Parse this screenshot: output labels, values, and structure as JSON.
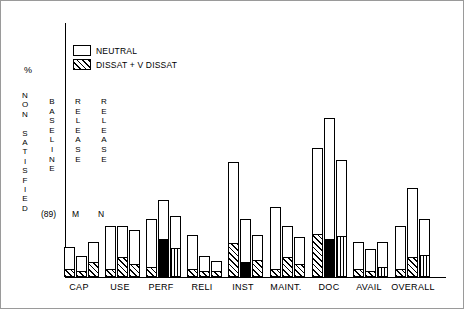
{
  "chart_data": {
    "type": "bar",
    "title": "",
    "xlabel": "",
    "ylabel": "% NON SATISFIED",
    "ylim": [
      0,
      100
    ],
    "grid": false,
    "legend_position": "top-left-inside",
    "legend": [
      {
        "label": "NEUTRAL",
        "pattern": "open"
      },
      {
        "label": "DISSAT + V DISSAT",
        "pattern": "diagonal-hatch"
      }
    ],
    "annotations": [
      {
        "text": "BASELINE",
        "orientation": "vertical",
        "note": "(89)"
      },
      {
        "text": "RELEASE",
        "orientation": "vertical",
        "note": "M"
      },
      {
        "text": "RELEASE",
        "orientation": "vertical",
        "note": "N"
      }
    ],
    "categories": [
      "CAP",
      "USE",
      "PERF",
      "RELI",
      "INST",
      "MAINT.",
      "DOC",
      "AVAIL",
      "OVERALL"
    ],
    "series": [
      {
        "name": "NEUTRAL",
        "pattern": "open"
      },
      {
        "name": "DISSAT + V DISSAT",
        "pattern": "hatch"
      }
    ],
    "groups": [
      {
        "category": "CAP",
        "bars": [
          {
            "release": "BASELINE (89)",
            "total": 13,
            "neutral": 10,
            "dissat": 3
          },
          {
            "release": "RELEASE M",
            "total": 9,
            "neutral": 7,
            "dissat": 2
          },
          {
            "release": "RELEASE N",
            "total": 15,
            "neutral": 9,
            "dissat": 6
          }
        ]
      },
      {
        "category": "USE",
        "bars": [
          {
            "release": "BASELINE (89)",
            "total": 22,
            "neutral": 19,
            "dissat": 3
          },
          {
            "release": "RELEASE M",
            "total": 22,
            "neutral": 14,
            "dissat": 8
          },
          {
            "release": "RELEASE N",
            "total": 20,
            "neutral": 15,
            "dissat": 5
          }
        ]
      },
      {
        "category": "PERF",
        "bars": [
          {
            "release": "BASELINE (89)",
            "total": 25,
            "neutral": 21,
            "dissat": 4
          },
          {
            "release": "RELEASE M",
            "total": 33,
            "neutral": 17,
            "dissat": 16
          },
          {
            "release": "RELEASE N",
            "total": 26,
            "neutral": 14,
            "dissat": 12
          }
        ]
      },
      {
        "category": "RELI",
        "bars": [
          {
            "release": "BASELINE (89)",
            "total": 18,
            "neutral": 15,
            "dissat": 3
          },
          {
            "release": "RELEASE M",
            "total": 9,
            "neutral": 7,
            "dissat": 2
          },
          {
            "release": "RELEASE N",
            "total": 7,
            "neutral": 5,
            "dissat": 2
          }
        ]
      },
      {
        "category": "INST",
        "bars": [
          {
            "release": "BASELINE (89)",
            "total": 49,
            "neutral": 35,
            "dissat": 14
          },
          {
            "release": "RELEASE M",
            "total": 25,
            "neutral": 19,
            "dissat": 6
          },
          {
            "release": "RELEASE N",
            "total": 18,
            "neutral": 11,
            "dissat": 7
          }
        ]
      },
      {
        "category": "MAINT.",
        "bars": [
          {
            "release": "BASELINE (89)",
            "total": 30,
            "neutral": 27,
            "dissat": 3
          },
          {
            "release": "RELEASE M",
            "total": 22,
            "neutral": 14,
            "dissat": 8
          },
          {
            "release": "RELEASE N",
            "total": 17,
            "neutral": 12,
            "dissat": 5
          }
        ]
      },
      {
        "category": "DOC",
        "bars": [
          {
            "release": "BASELINE (89)",
            "total": 55,
            "neutral": 37,
            "dissat": 18
          },
          {
            "release": "RELEASE M",
            "total": 68,
            "neutral": 52,
            "dissat": 16
          },
          {
            "release": "RELEASE N",
            "total": 50,
            "neutral": 33,
            "dissat": 17
          }
        ]
      },
      {
        "category": "AVAIL",
        "bars": [
          {
            "release": "BASELINE (89)",
            "total": 15,
            "neutral": 12,
            "dissat": 3
          },
          {
            "release": "RELEASE M",
            "total": 12,
            "neutral": 10,
            "dissat": 2
          },
          {
            "release": "RELEASE N",
            "total": 15,
            "neutral": 11,
            "dissat": 4
          }
        ]
      },
      {
        "category": "OVERALL",
        "bars": [
          {
            "release": "BASELINE (89)",
            "total": 22,
            "neutral": 19,
            "dissat": 3
          },
          {
            "release": "RELEASE M",
            "total": 38,
            "neutral": 30,
            "dissat": 8
          },
          {
            "release": "RELEASE N",
            "total": 25,
            "neutral": 16,
            "dissat": 9
          }
        ]
      }
    ]
  },
  "axis": {
    "percent_symbol": "%",
    "ylabel_letters": "N\nO\nN\n \nS\nA\nT\nI\nS\nF\nI\nE\nD"
  },
  "legend": {
    "neutral": "NEUTRAL",
    "dissat": "DISSAT + V DISSAT"
  },
  "inplot": {
    "baseline": "B\nA\nS\nE\nL\nI\nN\nE",
    "release_m": "R\nE\nL\nE\nA\nS\nE",
    "release_n": "R\nE\nL\nE\nA\nS\nE",
    "baseline_note": "(89)",
    "m_note": "M",
    "n_note": "N"
  },
  "xticks": {
    "t0": "CAP",
    "t1": "USE",
    "t2": "PERF",
    "t3": "RELI",
    "t4": "INST",
    "t5": "MAINT.",
    "t6": "DOC",
    "t7": "AVAIL",
    "t8": "OVERALL"
  }
}
